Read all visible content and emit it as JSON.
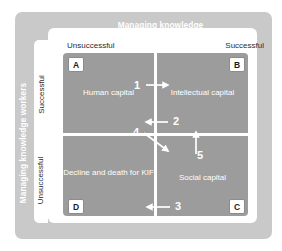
{
  "diagram": {
    "top_axis": {
      "title": "Managing knowledge",
      "left_label": "Unsuccessful",
      "right_label": "Successful"
    },
    "left_axis": {
      "title": "Managing knowledge workers",
      "top_label": "Successful",
      "bottom_label": "Unsuccessful"
    },
    "quadrants": [
      {
        "key": "A",
        "letter": "A",
        "caption": "Human capital"
      },
      {
        "key": "B",
        "letter": "B",
        "caption": "Intellectual capital"
      },
      {
        "key": "D",
        "letter": "D",
        "caption": "Decline and death for KIF"
      },
      {
        "key": "C",
        "letter": "C",
        "caption": "Social capital"
      }
    ],
    "arrows": [
      {
        "label": "1",
        "direction": "right"
      },
      {
        "label": "2",
        "direction": "left"
      },
      {
        "label": "3",
        "direction": "left"
      },
      {
        "label": "4",
        "direction": "diagonal-down-right"
      },
      {
        "label": "5",
        "direction": "up"
      }
    ],
    "colors": {
      "outer_panel": "#c9c9c9",
      "card": "#ffffff",
      "quadrant_fill": "#9c9c9c",
      "text_on_fill": "#ffffff",
      "text_dark": "#2b2b2b"
    }
  }
}
